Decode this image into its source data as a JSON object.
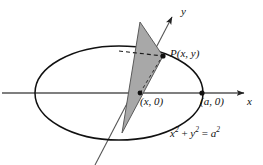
{
  "figure": {
    "width": 263,
    "height": 165,
    "background_color": "#ffffff",
    "stroke_color": "#111111",
    "axis_color": "#444444",
    "shade_fill_color": "#a8a8a8",
    "shade_stroke_color": "#555555"
  },
  "axes": {
    "x_axis": {
      "label": "x",
      "orientation": "horizontal",
      "arrow": "right",
      "y_position": 93,
      "x_start": 2,
      "x_end": 252
    },
    "y_axis": {
      "label": "y",
      "orientation": "oblique",
      "arrow": "up-right",
      "x_start": 95,
      "y_start": 165,
      "x_end": 176,
      "y_end": 10
    }
  },
  "curve": {
    "name": "circle-in-perspective",
    "equation": "x² + y² = a²",
    "equation_parts": {
      "x_var": "x",
      "y_var": "y",
      "a_var": "a",
      "exponent": "2",
      "plus": "+",
      "equals": "="
    },
    "center_x": 119,
    "center_y": 93,
    "radius_x": 84,
    "radius_y": 47
  },
  "points": [
    {
      "name": "point-p",
      "label": "P(x, y)",
      "label_parts": {
        "p": "P",
        "open": "(",
        "x": "x",
        "comma": ",",
        "y": "y",
        "close": ")"
      },
      "x": 163,
      "y": 56
    },
    {
      "name": "point-x-zero",
      "label": "(x, 0)",
      "label_parts": {
        "open": "(",
        "x": "x",
        "comma": ",",
        "zero": "0",
        "close": ")"
      },
      "x": 140,
      "y": 93
    },
    {
      "name": "point-a-zero",
      "label": "(a, 0)",
      "label_parts": {
        "open": "(",
        "a": "a",
        "comma": ",",
        "zero": "0",
        "close": ")"
      },
      "x": 202,
      "y": 93
    }
  ],
  "shaded_region": {
    "name": "triangular-cross-section",
    "vertices": [
      {
        "x": 140,
        "y": 22
      },
      {
        "x": 163,
        "y": 56
      },
      {
        "x": 122,
        "y": 133
      }
    ],
    "fill": "#a8a8a8"
  },
  "dashed_segments": [
    {
      "name": "chord-dashed",
      "x1": 120,
      "y1": 52,
      "x2": 163,
      "y2": 56
    },
    {
      "name": "radius-dashed",
      "x1": 140,
      "y1": 93,
      "x2": 163,
      "y2": 56
    }
  ]
}
